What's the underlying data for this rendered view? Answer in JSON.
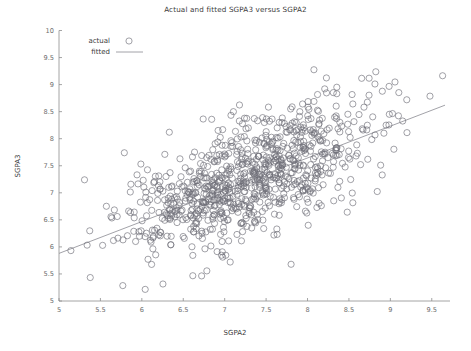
{
  "chart_data": {
    "type": "scatter",
    "title": "Actual and fitted SGPA3 versus SGPA2",
    "xlabel": "SGPA2",
    "ylabel": "SGPA3",
    "xlim": [
      5,
      9.72
    ],
    "ylim": [
      5,
      10
    ],
    "xticks": [
      5,
      5.5,
      6,
      6.5,
      7,
      7.5,
      8,
      8.5,
      9,
      9.5
    ],
    "yticks": [
      5,
      5.5,
      6,
      6.5,
      7,
      7.5,
      8,
      8.5,
      9,
      9.5,
      10
    ],
    "xticklabels": [
      "5",
      "5.5",
      "6",
      "6.5",
      "7",
      "7.5",
      "8",
      "8.5",
      "9",
      "9.5"
    ],
    "yticklabels": [
      "5",
      "5.5",
      "6",
      "6.5",
      "7",
      "7.5",
      "8",
      "8.5",
      "9",
      "9.5",
      "10"
    ],
    "grid": false,
    "legend_position": "upper left",
    "legend": [
      {
        "name": "actual",
        "marker": "open-circle",
        "color": "#6f6f78"
      },
      {
        "name": "fitted",
        "marker": "line",
        "color": "#8a8a92"
      }
    ],
    "series": [
      {
        "name": "actual",
        "type": "scatter",
        "marker": "open-circle",
        "marker_size": 3.1,
        "color": "#6f6f78",
        "n_points": 900,
        "x_mean": 7.32,
        "x_std": 0.78,
        "y_mean": 7.28,
        "y_std": 0.72,
        "correlation": 0.68,
        "x_range": [
          5.02,
          9.68
        ],
        "y_range": [
          5.08,
          9.86
        ]
      },
      {
        "name": "fitted",
        "type": "line",
        "color": "#8a8a92",
        "endpoints": [
          [
            5.0,
            5.88
          ],
          [
            9.66,
            8.62
          ]
        ],
        "slope": 0.588,
        "intercept": 2.94
      }
    ]
  },
  "legend_text": {
    "actual": "actual",
    "fitted": "fitted"
  }
}
